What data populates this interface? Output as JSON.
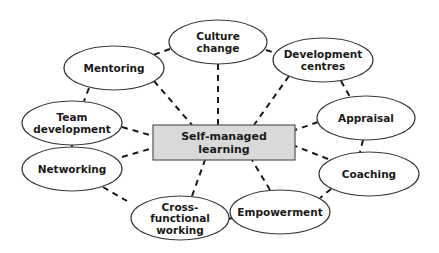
{
  "diagram": {
    "type": "hub-and-spoke",
    "center": {
      "id": "self-managed-learning",
      "lines": [
        "Self-managed",
        "learning"
      ],
      "box": {
        "x": 153,
        "y": 125,
        "w": 142,
        "h": 35
      },
      "fill": "#d9d9d9"
    },
    "nodes": [
      {
        "id": "culture-change",
        "lines": [
          "Culture",
          "change"
        ],
        "cx": 218,
        "cy": 42,
        "rx": 49,
        "ry": 22
      },
      {
        "id": "mentoring",
        "lines": [
          "Mentoring"
        ],
        "cx": 114,
        "cy": 68,
        "rx": 50,
        "ry": 22
      },
      {
        "id": "development-centres",
        "lines": [
          "Development",
          "centres"
        ],
        "cx": 323,
        "cy": 60,
        "rx": 50,
        "ry": 22
      },
      {
        "id": "team-development",
        "lines": [
          "Team",
          "development"
        ],
        "cx": 72,
        "cy": 123,
        "rx": 50,
        "ry": 22
      },
      {
        "id": "appraisal",
        "lines": [
          "Appraisal"
        ],
        "cx": 366,
        "cy": 118,
        "rx": 49,
        "ry": 22
      },
      {
        "id": "networking",
        "lines": [
          "Networking"
        ],
        "cx": 72,
        "cy": 169,
        "rx": 50,
        "ry": 22
      },
      {
        "id": "coaching",
        "lines": [
          "Coaching"
        ],
        "cx": 369,
        "cy": 174,
        "rx": 50,
        "ry": 22
      },
      {
        "id": "cross-functional-working",
        "lines": [
          "Cross-",
          "functional",
          "working"
        ],
        "cx": 180,
        "cy": 218,
        "rx": 49,
        "ry": 22
      },
      {
        "id": "empowerment",
        "lines": [
          "Empowerment"
        ],
        "cx": 280,
        "cy": 212,
        "rx": 50,
        "ry": 22
      }
    ],
    "connectors": [
      {
        "from": "culture-change",
        "to": "self-managed-learning",
        "x1": 218,
        "y1": 64,
        "x2": 218,
        "y2": 125
      },
      {
        "from": "mentoring",
        "to": "self-managed-learning",
        "x1": 154,
        "y1": 81,
        "x2": 192,
        "y2": 125
      },
      {
        "from": "development-centres",
        "to": "self-managed-learning",
        "x1": 289,
        "y1": 76,
        "x2": 254,
        "y2": 125
      },
      {
        "from": "team-development",
        "to": "self-managed-learning",
        "x1": 122,
        "y1": 127,
        "x2": 153,
        "y2": 136
      },
      {
        "from": "networking",
        "to": "self-managed-learning",
        "x1": 122,
        "y1": 157,
        "x2": 153,
        "y2": 148
      },
      {
        "from": "appraisal",
        "to": "self-managed-learning",
        "x1": 318,
        "y1": 122,
        "x2": 295,
        "y2": 130
      },
      {
        "from": "coaching",
        "to": "self-managed-learning",
        "x1": 328,
        "y1": 159,
        "x2": 295,
        "y2": 146
      },
      {
        "from": "cross-functional-working",
        "to": "self-managed-learning",
        "x1": 192,
        "y1": 196,
        "x2": 205,
        "y2": 160
      },
      {
        "from": "empowerment",
        "to": "self-managed-learning",
        "x1": 270,
        "y1": 190,
        "x2": 252,
        "y2": 160
      },
      {
        "from": "culture-change",
        "to": "mentoring",
        "x1": 170,
        "y1": 49,
        "x2": 153,
        "y2": 55
      },
      {
        "from": "culture-change",
        "to": "development-centres",
        "x1": 266,
        "y1": 50,
        "x2": 275,
        "y2": 53
      },
      {
        "from": "mentoring",
        "to": "team-development",
        "x1": 89,
        "y1": 88,
        "x2": 84,
        "y2": 101
      },
      {
        "from": "development-centres",
        "to": "appraisal",
        "x1": 341,
        "y1": 81,
        "x2": 350,
        "y2": 97
      },
      {
        "from": "team-development",
        "to": "networking",
        "x1": 72,
        "y1": 145,
        "x2": 72,
        "y2": 147
      },
      {
        "from": "appraisal",
        "to": "coaching",
        "x1": 363,
        "y1": 140,
        "x2": 360,
        "y2": 152
      },
      {
        "from": "networking",
        "to": "cross-functional-working",
        "x1": 103,
        "y1": 187,
        "x2": 127,
        "y2": 201
      },
      {
        "from": "coaching",
        "to": "empowerment",
        "x1": 331,
        "y1": 189,
        "x2": 320,
        "y2": 198
      },
      {
        "from": "cross-functional-working",
        "to": "empowerment",
        "x1": 229,
        "y1": 219,
        "x2": 232,
        "y2": 218
      }
    ]
  }
}
